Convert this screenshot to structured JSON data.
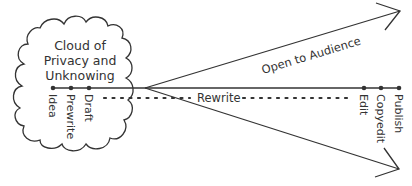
{
  "diagram": {
    "cloud": {
      "lines": [
        "Cloud of",
        "Privacy and",
        "Unknowing"
      ]
    },
    "early_stages": [
      "Idea",
      "Prewrite",
      "Draft"
    ],
    "late_stages": [
      "Edit",
      "Copyedit",
      "Publish"
    ],
    "labels": {
      "open": "Open to Audience",
      "rewrite": "Rewrite"
    },
    "colors": {
      "stroke": "#333333",
      "background": "#ffffff"
    }
  }
}
